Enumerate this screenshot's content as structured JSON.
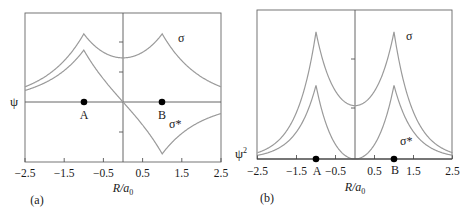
{
  "chart_data": [
    {
      "type": "line",
      "panel_label": "(a)",
      "title": "",
      "xlabel": "R/a0",
      "ylabel": "ψ",
      "xlim": [
        -2.5,
        2.5
      ],
      "x_ticks": [
        "−2.5",
        "−1.5",
        "−0.5",
        "0.5",
        "1.5",
        "2.5"
      ],
      "grid": false,
      "series": [
        {
          "name": "σ",
          "formula": "exp(-|x+1|) + exp(-|x-1|)",
          "x": [
            -2.5,
            -2,
            -1.5,
            -1,
            -0.5,
            0,
            0.5,
            1,
            1.5,
            2,
            2.5
          ],
          "values": [
            0.253,
            0.418,
            0.689,
            1.135,
            0.83,
            0.736,
            0.83,
            1.135,
            0.689,
            0.418,
            0.253
          ]
        },
        {
          "name": "σ*",
          "formula": "exp(-|x+1|) - exp(-|x-1|)",
          "x": [
            -2.5,
            -2,
            -1.5,
            -1,
            -0.5,
            0,
            0.5,
            1,
            1.5,
            2,
            2.5
          ],
          "values": [
            0.193,
            0.318,
            0.524,
            0.865,
            0.384,
            0.0,
            -0.384,
            -0.865,
            -0.524,
            -0.318,
            -0.193
          ]
        }
      ],
      "points": [
        {
          "label": "A",
          "x": -1,
          "y": 0
        },
        {
          "label": "B",
          "x": 1,
          "y": 0
        }
      ]
    },
    {
      "type": "line",
      "panel_label": "(b)",
      "title": "",
      "xlabel": "R/a0",
      "ylabel": "ψ²",
      "xlim": [
        -2.5,
        2.5
      ],
      "x_ticks": [
        "−2.5",
        "−1.5",
        "−0.5",
        "0.5",
        "1.5",
        "2.5"
      ],
      "grid": false,
      "series": [
        {
          "name": "σ",
          "formula": "(exp(-|x+1|) + exp(-|x-1|))^2",
          "x": [
            -2.5,
            -2,
            -1.5,
            -1,
            -0.5,
            0,
            0.5,
            1,
            1.5,
            2,
            2.5
          ],
          "values": [
            0.064,
            0.175,
            0.475,
            1.288,
            0.689,
            0.541,
            0.689,
            1.288,
            0.475,
            0.175,
            0.064
          ]
        },
        {
          "name": "σ*",
          "formula": "(exp(-|x+1|) - exp(-|x-1|))^2",
          "x": [
            -2.5,
            -2,
            -1.5,
            -1,
            -0.5,
            0,
            0.5,
            1,
            1.5,
            2,
            2.5
          ],
          "values": [
            0.037,
            0.101,
            0.275,
            0.748,
            0.147,
            0.0,
            0.147,
            0.748,
            0.275,
            0.101,
            0.037
          ]
        }
      ],
      "points": [
        {
          "label": "A",
          "x": -1,
          "y": 0
        },
        {
          "label": "B",
          "x": 1,
          "y": 0
        }
      ]
    }
  ],
  "labels": {
    "a": {
      "ylabel": "ψ",
      "xlabel_main": "R/a",
      "xlabel_sub": "0",
      "panel": "(a)",
      "sigma": "σ",
      "sigma_star": "σ*",
      "point_a": "A",
      "point_b": "B"
    },
    "b": {
      "ylabel": "ψ",
      "ylabel_sup": "2",
      "xlabel_main": "R/a",
      "xlabel_sub": "0",
      "panel": "(b)",
      "sigma": "σ",
      "sigma_star": "σ*",
      "point_a": "A",
      "point_b": "B"
    }
  },
  "colors": {
    "curve": "#9a9a9a",
    "axis": "#555555",
    "text": "#1a1a1a",
    "dot": "#000000"
  }
}
